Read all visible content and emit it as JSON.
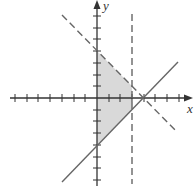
{
  "diagram": {
    "type": "graph-of-inequalities",
    "axes": {
      "x_label": "x",
      "y_label": "y",
      "x_range": [
        -7,
        8
      ],
      "y_range": [
        -7,
        8
      ],
      "tick_interval": 1
    },
    "boundary_lines": [
      {
        "name": "dashed-diagonal",
        "equation": "y = -x + 4",
        "style": "dashed"
      },
      {
        "name": "vertical-dashed",
        "equation": "x = 3",
        "style": "dashed"
      },
      {
        "name": "solid-diagonal",
        "equation": "y = x - 4",
        "style": "solid"
      }
    ],
    "shaded_region": {
      "description": "x ≥ 0, x < 3, y < -x + 4, y ≥ x - 4",
      "vertices": [
        [
          0,
          4
        ],
        [
          3,
          1
        ],
        [
          3,
          -1
        ],
        [
          0,
          -4
        ]
      ],
      "fill_color": "#d9d9d9"
    },
    "colors": {
      "axis": "#333333",
      "line": "#666666",
      "fill": "#d9d9d9"
    }
  }
}
